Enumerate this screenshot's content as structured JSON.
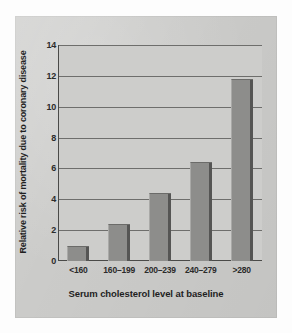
{
  "figure": {
    "background_color": "#ffffff",
    "panel_color": "#cbcbc9",
    "bar_color": "#8d8d8b",
    "axis_color": "#4a4a48",
    "grid_color": "#6e6e6c"
  },
  "chart_data": {
    "type": "bar",
    "title": "",
    "categories": [
      "<160",
      "160–199",
      "200–239",
      "240–279",
      ">280"
    ],
    "values": [
      1.0,
      2.4,
      4.4,
      6.4,
      11.8
    ],
    "xlabel": "Serum cholesterol level at baseline",
    "ylabel": "Relative risk of mortality due to coronary disease",
    "ylim": [
      0,
      14
    ],
    "yticks": [
      0,
      2,
      4,
      6,
      8,
      10,
      12,
      14
    ],
    "ytick_labels": [
      "0",
      "2",
      "4",
      "6",
      "8",
      "10",
      "12",
      "14"
    ],
    "grid": "horizontal",
    "legend": null
  }
}
